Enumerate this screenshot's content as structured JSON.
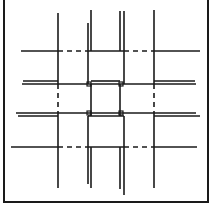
{
  "diagram": {
    "stroke_color": "#1a1a1a",
    "background": "#ffffff",
    "frame": {
      "left": 4,
      "right": 208,
      "top": 0,
      "bottom": 202,
      "edges_visible": [
        "left",
        "right",
        "bottom"
      ]
    },
    "vertical_strands": [
      {
        "id": "v1",
        "x": 58,
        "segments": [
          {
            "y1": 13,
            "y2": 84,
            "style": "solid"
          },
          {
            "y1": 84,
            "y2": 113,
            "style": "dashed"
          },
          {
            "y1": 113,
            "y2": 188,
            "style": "solid"
          }
        ]
      },
      {
        "id": "v2a",
        "x": 88,
        "segments": [
          {
            "y1": 23,
            "y2": 84,
            "style": "solid"
          },
          {
            "y1": 116,
            "y2": 184,
            "style": "solid"
          }
        ]
      },
      {
        "id": "v2b",
        "x": 91,
        "segments": [
          {
            "y1": 10,
            "y2": 51,
            "style": "solid"
          },
          {
            "y1": 84,
            "y2": 116,
            "style": "solid"
          },
          {
            "y1": 147,
            "y2": 188,
            "style": "solid"
          }
        ]
      },
      {
        "id": "v3a",
        "x": 120,
        "segments": [
          {
            "y1": 11,
            "y2": 51,
            "style": "solid"
          },
          {
            "y1": 84,
            "y2": 116,
            "style": "solid"
          },
          {
            "y1": 147,
            "y2": 189,
            "style": "solid"
          }
        ]
      },
      {
        "id": "v3b",
        "x": 124,
        "segments": [
          {
            "y1": 11,
            "y2": 84,
            "style": "solid"
          },
          {
            "y1": 116,
            "y2": 195,
            "style": "solid"
          }
        ]
      },
      {
        "id": "v4",
        "x": 154,
        "segments": [
          {
            "y1": 10,
            "y2": 84,
            "style": "solid"
          },
          {
            "y1": 84,
            "y2": 113,
            "style": "dashed"
          },
          {
            "y1": 113,
            "y2": 188,
            "style": "solid"
          }
        ]
      }
    ],
    "horizontal_strands": [
      {
        "id": "h1",
        "y": 51,
        "segments": [
          {
            "x1": 21,
            "x2": 58,
            "style": "solid"
          },
          {
            "x1": 58,
            "x2": 89,
            "style": "dashed"
          },
          {
            "x1": 89,
            "x2": 124,
            "style": "solid"
          },
          {
            "x1": 124,
            "x2": 154,
            "style": "dashed"
          },
          {
            "x1": 154,
            "x2": 200,
            "style": "solid"
          }
        ]
      },
      {
        "id": "h2a",
        "y": 81,
        "segments": [
          {
            "x1": 23,
            "x2": 58,
            "style": "solid"
          },
          {
            "x1": 91,
            "x2": 120,
            "style": "solid"
          },
          {
            "x1": 154,
            "x2": 195,
            "style": "solid"
          }
        ]
      },
      {
        "id": "h2b",
        "y": 84,
        "segments": [
          {
            "x1": 22,
            "x2": 196,
            "style": "solid"
          }
        ]
      },
      {
        "id": "h3a",
        "y": 113,
        "segments": [
          {
            "x1": 16,
            "x2": 196,
            "style": "solid"
          }
        ]
      },
      {
        "id": "h3b",
        "y": 116,
        "segments": [
          {
            "x1": 18,
            "x2": 58,
            "style": "solid"
          },
          {
            "x1": 88,
            "x2": 124,
            "style": "solid"
          },
          {
            "x1": 154,
            "x2": 200,
            "style": "solid"
          }
        ]
      },
      {
        "id": "h4",
        "y": 147,
        "segments": [
          {
            "x1": 11,
            "x2": 58,
            "style": "solid"
          },
          {
            "x1": 58,
            "x2": 88,
            "style": "dashed"
          },
          {
            "x1": 88,
            "x2": 124,
            "style": "solid"
          },
          {
            "x1": 124,
            "x2": 154,
            "style": "dashed"
          },
          {
            "x1": 154,
            "x2": 197,
            "style": "solid"
          }
        ]
      }
    ],
    "corner_knots": [
      {
        "x": 89,
        "y": 84
      },
      {
        "x": 121,
        "y": 84
      },
      {
        "x": 89,
        "y": 113
      },
      {
        "x": 121,
        "y": 113
      }
    ]
  }
}
